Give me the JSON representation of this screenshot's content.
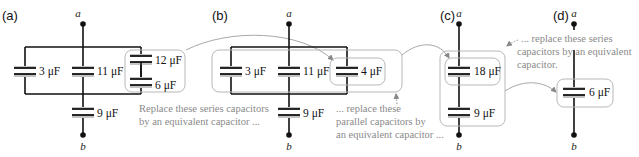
{
  "figure": {
    "panels": [
      {
        "id": "a",
        "label": "(a)",
        "node_top": "a",
        "node_bottom": "b",
        "capacitors": [
          {
            "label": "3 μF"
          },
          {
            "label": "11 μF"
          },
          {
            "label": "12 μF"
          },
          {
            "label": "6 μF"
          },
          {
            "label": "9 μF"
          }
        ],
        "note": [
          "Replace these series capacitors",
          "by an equivalent capacitor ..."
        ]
      },
      {
        "id": "b",
        "label": "(b)",
        "node_top": "a",
        "node_bottom": "b",
        "capacitors": [
          {
            "label": "3 μF"
          },
          {
            "label": "11 μF"
          },
          {
            "label": "4 μF"
          },
          {
            "label": "9 μF"
          }
        ],
        "note": [
          "... replace these",
          "parallel capacitors by",
          "an equivalent capacitor ..."
        ]
      },
      {
        "id": "c",
        "label": "(c)",
        "node_top": "a",
        "node_bottom": "b",
        "capacitors": [
          {
            "label": "18 μF"
          },
          {
            "label": "9 μF"
          }
        ],
        "note": [
          "... replace these series",
          "capacitors by an equivalent",
          "capacitor."
        ]
      },
      {
        "id": "d",
        "label": "(d)",
        "node_top": "a",
        "node_bottom": "b",
        "capacitors": [
          {
            "label": "6 μF"
          }
        ]
      }
    ],
    "colors": {
      "wire": "#111111",
      "plate_shadow": "#c4c4c4",
      "annotation": "#8a8a8a",
      "box": "#b8b8b8"
    }
  }
}
